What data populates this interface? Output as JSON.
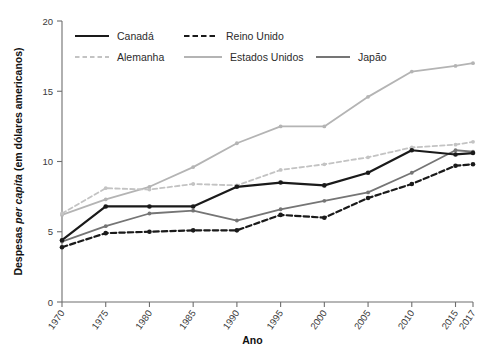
{
  "chart_data": {
    "type": "line",
    "title": "",
    "xlabel": "Ano",
    "ylabel_prefix": "Despesas ",
    "ylabel_italic": "per capita",
    "ylabel_suffix": " (em dólares americanos)",
    "ylabel": "Despesas per capita (em dólares americanos)",
    "categories": [
      "1970",
      "1975",
      "1980",
      "1985",
      "1990",
      "1995",
      "2000",
      "2005",
      "2010",
      "2015",
      "2017"
    ],
    "x": [
      1970,
      1975,
      1980,
      1985,
      1990,
      1995,
      2000,
      2005,
      2010,
      2015,
      2017
    ],
    "xlim": [
      1970,
      2017
    ],
    "ylim": [
      0,
      20
    ],
    "yticks": [
      0,
      5,
      10,
      15,
      20
    ],
    "xticks": [
      "1970",
      "1975",
      "1980",
      "1985",
      "1990",
      "1995",
      "2000",
      "2005",
      "2010",
      "2015",
      "2017"
    ],
    "grid": false,
    "legend_position": "top-left-inside",
    "series": [
      {
        "name": "Canadá",
        "color": "#1a1a1a",
        "style": "solid",
        "width": 2.2,
        "values": [
          4.4,
          6.8,
          6.8,
          6.8,
          8.2,
          8.5,
          8.3,
          9.2,
          10.8,
          10.5,
          10.6
        ]
      },
      {
        "name": "Reino Unido",
        "color": "#1a1a1a",
        "style": "dashed",
        "width": 2.2,
        "values": [
          3.9,
          4.9,
          5.0,
          5.1,
          5.1,
          6.2,
          6.0,
          7.4,
          8.4,
          9.7,
          9.8
        ]
      },
      {
        "name": "Alemanha",
        "color": "#c3c3c3",
        "style": "dashed",
        "width": 1.8,
        "values": [
          6.3,
          8.1,
          8.0,
          8.4,
          8.3,
          9.4,
          9.8,
          10.3,
          11.0,
          11.2,
          11.4
        ]
      },
      {
        "name": "Estados Unidos",
        "color": "#b4b4b4",
        "style": "solid",
        "width": 1.8,
        "values": [
          6.2,
          7.3,
          8.2,
          9.6,
          11.3,
          12.5,
          12.5,
          14.6,
          16.4,
          16.8,
          17.0
        ]
      },
      {
        "name": "Japão",
        "color": "#757575",
        "style": "solid",
        "width": 1.8,
        "values": [
          4.3,
          5.4,
          6.3,
          6.5,
          5.8,
          6.6,
          7.2,
          7.8,
          9.2,
          10.8,
          10.7
        ]
      }
    ]
  },
  "legend": {
    "entries": [
      {
        "label": "Canadá",
        "series": 0
      },
      {
        "label": "Reino Unido",
        "series": 1
      },
      {
        "label": "Alemanha",
        "series": 2
      },
      {
        "label": "Estados Unidos",
        "series": 3
      },
      {
        "label": "Japão",
        "series": 4
      }
    ]
  }
}
